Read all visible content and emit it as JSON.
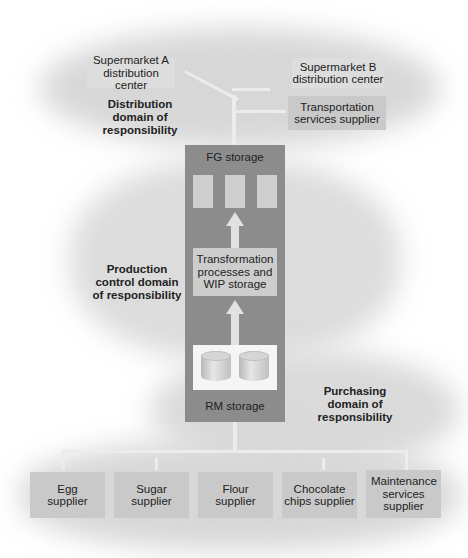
{
  "diagram": {
    "distribution": {
      "domain_label": "Distribution domain of responsibility",
      "supermarket_a": "Supermarket A distribution center",
      "supermarket_b": "Supermarket B distribution center",
      "transport": "Transportation services supplier"
    },
    "production": {
      "domain_label": "Production control domain of responsibility",
      "fg_storage": "FG storage",
      "transformation": "Transformation processes and WIP storage",
      "rm_storage": "RM storage"
    },
    "purchasing": {
      "domain_label": "Purchasing domain of responsibility",
      "suppliers": [
        "Egg supplier",
        "Sugar supplier",
        "Flour supplier",
        "Chocolate chips supplier",
        "Maintenance services supplier"
      ]
    },
    "colors": {
      "container": "#8c8c8c",
      "box": "#c9c9c9",
      "cloud": "#d7d7d7",
      "arrow": "#e2e2e2"
    }
  }
}
